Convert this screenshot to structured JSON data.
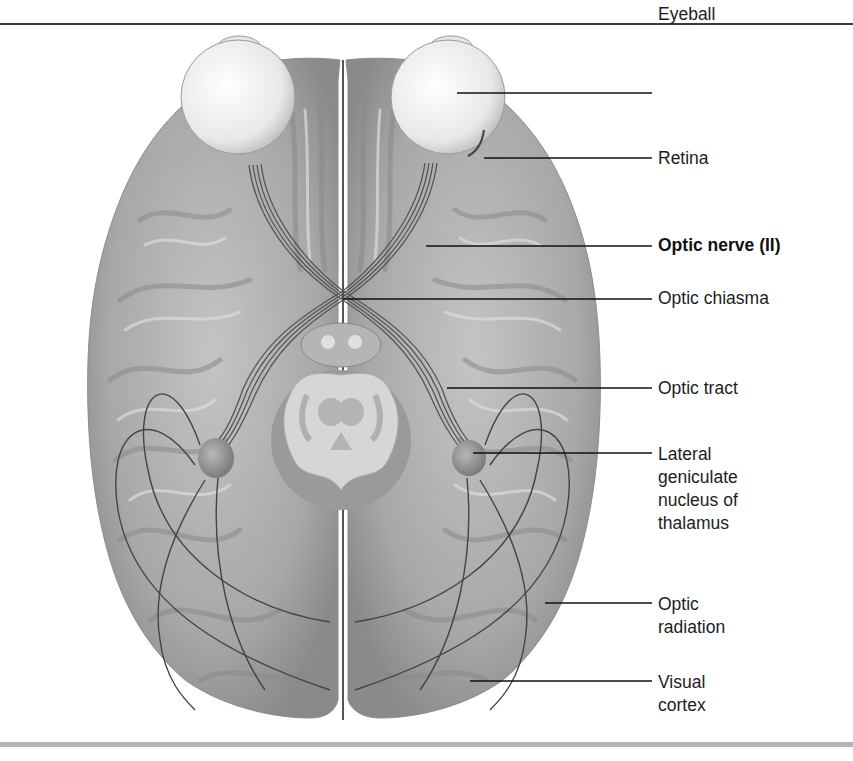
{
  "figure": {
    "colors": {
      "background": "#ffffff",
      "top_rule": "#3a3a3a",
      "bottom_rule": "#b4b4b4",
      "brain_fill": "#a9a9a9",
      "brain_shadow": "#7a7a7a",
      "eyeball_fill": "#f2f2f2",
      "nerve_stroke": "#555555",
      "leader_line": "#111111",
      "label_text": "#1d1d1d"
    }
  },
  "labels": [
    {
      "id": "eyeball",
      "lines": [
        "Eyeball"
      ],
      "bold": false,
      "top": 3,
      "leader": {
        "x1": 457,
        "x2": 652,
        "y": 93
      }
    },
    {
      "id": "retina",
      "lines": [
        "Retina"
      ],
      "bold": false,
      "top": 147,
      "leader": {
        "x1": 484,
        "x2": 652,
        "y": 158
      }
    },
    {
      "id": "optic-nerve",
      "lines": [
        "Optic nerve (II)"
      ],
      "bold": true,
      "top": 234,
      "leader": {
        "x1": 426,
        "x2": 652,
        "y": 246
      }
    },
    {
      "id": "optic-chiasma",
      "lines": [
        "Optic chiasma"
      ],
      "bold": false,
      "top": 287,
      "leader": {
        "x1": 343,
        "x2": 652,
        "y": 299
      }
    },
    {
      "id": "optic-tract",
      "lines": [
        "Optic tract"
      ],
      "bold": false,
      "top": 377,
      "leader": {
        "x1": 447,
        "x2": 652,
        "y": 388
      }
    },
    {
      "id": "lateral-geniculate",
      "lines": [
        "Lateral",
        "geniculate",
        "nucleus of",
        "thalamus"
      ],
      "bold": false,
      "top": 443,
      "leader": {
        "x1": 473,
        "x2": 652,
        "y": 453
      }
    },
    {
      "id": "optic-radiation",
      "lines": [
        "Optic",
        "radiation"
      ],
      "bold": false,
      "top": 593,
      "leader": {
        "x1": 545,
        "x2": 652,
        "y": 603
      }
    },
    {
      "id": "visual-cortex",
      "lines": [
        "Visual",
        "cortex"
      ],
      "bold": false,
      "top": 671,
      "leader": {
        "x1": 470,
        "x2": 652,
        "y": 681
      }
    }
  ]
}
